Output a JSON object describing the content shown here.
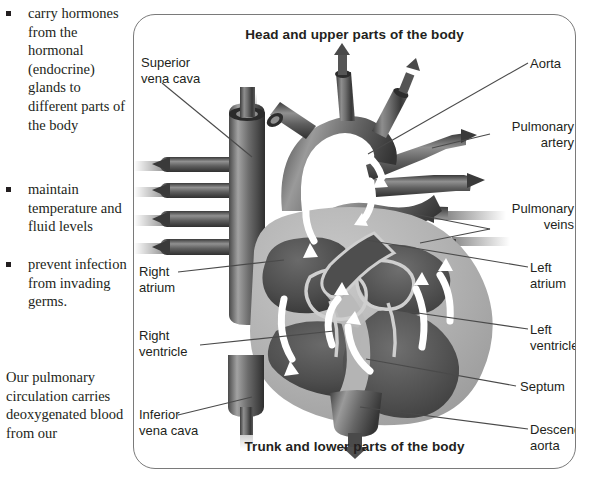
{
  "text_column": {
    "bullets": [
      {
        "text": "carry hormones from the hormonal (endocrine) glands to different parts of the body"
      },
      {
        "text": "maintain temperature and fluid levels"
      },
      {
        "text": "prevent infection from invading germs."
      }
    ],
    "paragraph": "Our pulmonary circulation carries deoxygenated blood from our"
  },
  "diagram": {
    "caption_top": "Head and upper parts of the body",
    "caption_bottom": "Trunk and lower parts of the body",
    "labels": {
      "superior_vena_cava": "Superior\nvena cava",
      "aorta": "Aorta",
      "pulmonary_artery": "Pulmonary\nartery",
      "pulmonary_veins": "Pulmonary\nveins",
      "right_atrium": "Right\natrium",
      "left_atrium": "Left\natrium",
      "right_ventricle": "Right\nventricle",
      "left_ventricle": "Left\nventricle",
      "septum": "Septum",
      "inferior_vena_cava": "Inferior\nvena cava",
      "descending_aorta": "Descending\naorta"
    },
    "colors": {
      "border": "#7a7a7a",
      "text": "#231f20",
      "leader_line": "#4a4a4a",
      "myocardium_light": "#b4b4b4",
      "chamber_dark": "#4f4f4f",
      "vessel_dark": "#565656",
      "flow_arrow": "#ffffff"
    }
  }
}
